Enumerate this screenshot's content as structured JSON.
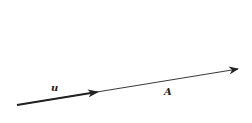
{
  "diagram": {
    "vectors": [
      {
        "name": "u",
        "label": "u",
        "kind": "unit-vector",
        "style": "thick"
      },
      {
        "name": "A",
        "label": "A",
        "kind": "vector",
        "style": "thin"
      }
    ],
    "colors": {
      "stroke": "#222222",
      "background": "#ffffff"
    }
  }
}
